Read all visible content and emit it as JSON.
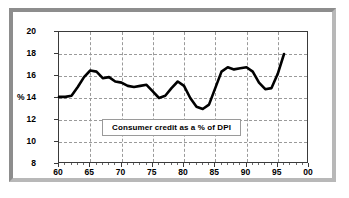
{
  "chart_data": {
    "type": "line",
    "title": "",
    "xlabel": "",
    "ylabel": "%",
    "ylim": [
      8,
      20
    ],
    "xlim": [
      1960,
      2000
    ],
    "grid": true,
    "legend_position": "inside-bottom-center",
    "legend_label": "Consumer credit as a % of DPI",
    "y_ticks": [
      "20",
      "18",
      "16",
      "14",
      "12",
      "10",
      "8"
    ],
    "y_tick_values": [
      20,
      18,
      16,
      14,
      12,
      10,
      8
    ],
    "y_axis_unit_marker": "%",
    "x_ticks": [
      "60",
      "65",
      "70",
      "75",
      "80",
      "85",
      "90",
      "95",
      "00"
    ],
    "x_tick_values": [
      1960,
      1965,
      1970,
      1975,
      1980,
      1985,
      1990,
      1995,
      2000
    ],
    "series": [
      {
        "name": "Consumer credit as a % of DPI",
        "color": "#000000",
        "x": [
          1960,
          1961,
          1962,
          1963,
          1964,
          1965,
          1966,
          1967,
          1968,
          1969,
          1970,
          1971,
          1972,
          1973,
          1974,
          1975,
          1976,
          1977,
          1978,
          1979,
          1980,
          1981,
          1982,
          1983,
          1984,
          1985,
          1986,
          1987,
          1988,
          1989,
          1990,
          1991,
          1992,
          1993,
          1994,
          1995,
          1996
        ],
        "values": [
          14.1,
          14.1,
          14.2,
          15.0,
          15.9,
          16.5,
          16.4,
          15.8,
          15.9,
          15.5,
          15.4,
          15.1,
          15.0,
          15.1,
          15.2,
          14.6,
          14.0,
          14.2,
          14.9,
          15.5,
          15.1,
          14.0,
          13.2,
          13.0,
          13.4,
          14.9,
          16.4,
          16.8,
          16.6,
          16.7,
          16.8,
          16.4,
          15.4,
          14.8,
          14.9,
          16.2,
          18.0
        ]
      }
    ]
  },
  "axes": {
    "y_label_pct": "%"
  }
}
